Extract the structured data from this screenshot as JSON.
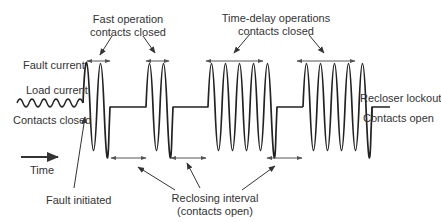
{
  "labels": {
    "fast_operation_line1": "Fast operation",
    "fast_operation_line2": "contacts closed",
    "time_delay_line1": "Time-delay operations",
    "time_delay_line2": "contacts closed",
    "fault_current": "Fault current",
    "load_current": "Load current",
    "contacts_closed": "Contacts closed",
    "recloser_lockout": "Recloser lockout",
    "contacts_open": "Contacts open",
    "time": "Time",
    "fault_initiated": "Fault initiated",
    "reclosing_interval_line1": "Reclosing interval",
    "reclosing_interval_line2": "(contacts open)"
  },
  "colors": {
    "waveform": "#222222",
    "arrows": "#555555",
    "text": "#333333"
  },
  "sequence": [
    {
      "phase": "load current",
      "cycles": 6
    },
    {
      "phase": "fast operation 1",
      "cycles": 2
    },
    {
      "phase": "reclosing interval 1"
    },
    {
      "phase": "fast operation 2",
      "cycles": 2
    },
    {
      "phase": "reclosing interval 2"
    },
    {
      "phase": "time-delay operation 1",
      "cycles": 5
    },
    {
      "phase": "reclosing interval 3"
    },
    {
      "phase": "time-delay operation 2",
      "cycles": 5
    },
    {
      "phase": "recloser lockout"
    }
  ]
}
